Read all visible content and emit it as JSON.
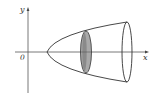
{
  "diagram": {
    "type": "solid-of-revolution",
    "labels": {
      "y_axis": "y",
      "x_axis": "x",
      "origin": "0"
    },
    "colors": {
      "stroke": "#333333",
      "disk_fill": "#a9a9a9",
      "disk_shade": "#7f7f7f",
      "background": "#ffffff"
    },
    "elements": {
      "x_axis": {
        "x1": 15,
        "y": 52,
        "x2": 149
      },
      "y_axis": {
        "x": 28,
        "y1": 93,
        "y2": 8
      },
      "parabola_vertex": {
        "x": 47,
        "y": 52
      },
      "opening_end": {
        "cx": 127,
        "cy": 52,
        "rx": 5,
        "ry": 30
      },
      "cross_section_disk": {
        "cx": 86,
        "cy": 52,
        "rx": 5,
        "ry": 21
      }
    }
  }
}
